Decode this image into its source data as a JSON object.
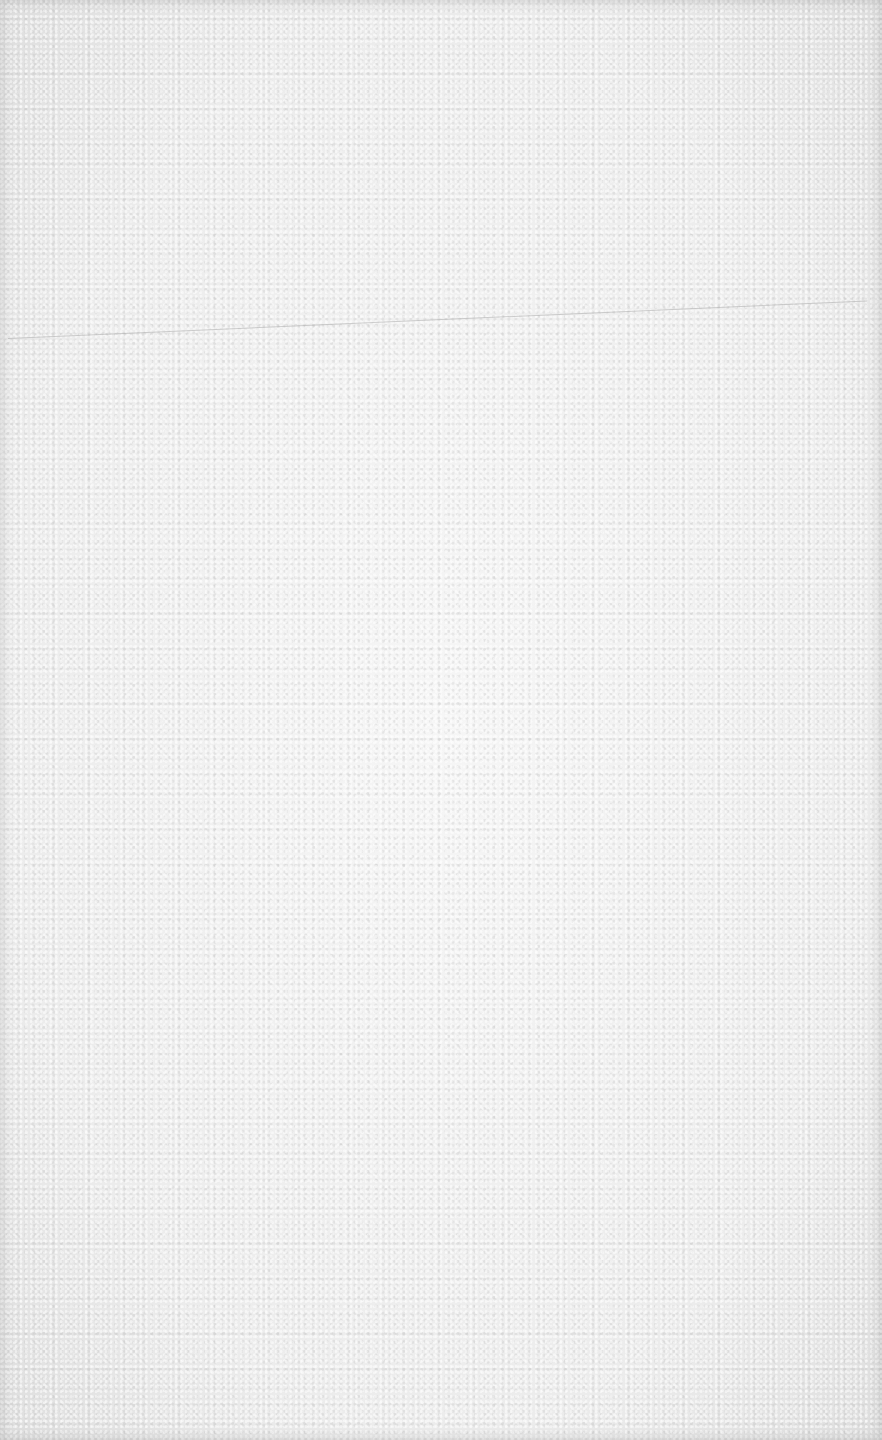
{
  "image": {
    "description": "Blank white textured paper surface",
    "colors": {
      "paper": "#f1f1f1",
      "edge_shadow": "#d9d9d9",
      "scratch_line": "#aaaaaa"
    },
    "features": [
      {
        "type": "faint-scratch-line",
        "from": [
          8,
          338
        ],
        "to": [
          868,
          300
        ]
      }
    ],
    "text": ""
  }
}
